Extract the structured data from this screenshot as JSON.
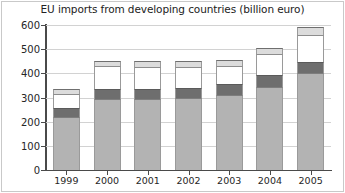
{
  "chart_data": {
    "type": "bar",
    "subtype": "stacked-bar",
    "title": "EU imports from developing countries (billion euro)",
    "xlabel": "",
    "ylabel": "",
    "ylim": [
      0,
      600
    ],
    "ytick_step": 100,
    "yticks": [
      0,
      100,
      200,
      300,
      400,
      500,
      600
    ],
    "grid": true,
    "legend": "none",
    "categories": [
      "1999",
      "2000",
      "2001",
      "2002",
      "2003",
      "2004",
      "2005"
    ],
    "series": [
      {
        "name": "segment-1",
        "color": "#b3b3b3",
        "values": [
          220,
          295,
          295,
          300,
          310,
          345,
          400
        ]
      },
      {
        "name": "segment-2",
        "color": "#6e6e6e",
        "values": [
          35,
          40,
          40,
          40,
          45,
          50,
          45
        ]
      },
      {
        "name": "segment-3",
        "color": "#ffffff",
        "values": [
          60,
          95,
          90,
          85,
          75,
          85,
          115
        ]
      },
      {
        "name": "segment-4",
        "color": "#dcdcdc",
        "values": [
          20,
          20,
          25,
          25,
          25,
          25,
          30
        ]
      }
    ],
    "totals": [
      335,
      450,
      450,
      450,
      455,
      505,
      590
    ]
  },
  "axes": {
    "y_tick_labels": [
      "600",
      "500",
      "400",
      "300",
      "200",
      "100",
      "0"
    ],
    "x_tick_labels": [
      "1999",
      "2000",
      "2001",
      "2002",
      "2003",
      "2004",
      "2005"
    ]
  }
}
